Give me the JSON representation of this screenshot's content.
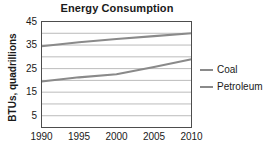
{
  "chart_data": {
    "type": "line",
    "title": "Energy Consumption",
    "xlabel": "",
    "ylabel": "BTUs, quadrillions",
    "x": [
      1990,
      1995,
      2000,
      2005,
      2010
    ],
    "xlim": [
      1990,
      2010
    ],
    "ylim": [
      0,
      45
    ],
    "xticks": [
      "1990",
      "1995",
      "2000",
      "2005",
      "2010"
    ],
    "yticks": [
      "5",
      "15",
      "25",
      "35",
      "45"
    ],
    "ytick_values": [
      5,
      15,
      25,
      35,
      45
    ],
    "gridlines_y": [
      5,
      10,
      15,
      20,
      25,
      30,
      35,
      40,
      45
    ],
    "grid": true,
    "legend_position": "right",
    "series": [
      {
        "name": "Petroleum",
        "color": "#8a8a8a",
        "values": [
          34.5,
          36.2,
          37.6,
          38.8,
          40.0
        ]
      },
      {
        "name": "Coal",
        "color": "#8a8a8a",
        "values": [
          19.5,
          21.3,
          22.6,
          25.7,
          29.0
        ]
      }
    ]
  },
  "legend": {
    "items": [
      {
        "label": "Coal",
        "color": "#8a8a8a"
      },
      {
        "label": "Petroleum",
        "color": "#8a8a8a"
      }
    ]
  },
  "colors": {
    "axis": "#4d4d4d",
    "grid": "#b3b3b3",
    "line": "#8a8a8a",
    "text": "#1a1a1a",
    "background": "#ffffff"
  }
}
